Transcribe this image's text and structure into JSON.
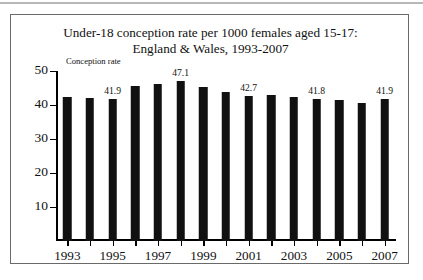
{
  "chart_data": {
    "type": "bar",
    "title": "Under-18 conception rate per 1000 females aged 15-17:",
    "subtitle": "England & Wales, 1993-2007",
    "axis_label": "Conception rate",
    "xlabel": "",
    "ylabel": "Conception rate",
    "ylim": [
      0,
      50
    ],
    "yticks": [
      10,
      20,
      30,
      40,
      50
    ],
    "grid": false,
    "legend": "none",
    "bar_color": "#111111",
    "categories": [
      "1993",
      "1994",
      "1995",
      "1996",
      "1997",
      "1998",
      "1999",
      "2000",
      "2001",
      "2002",
      "2003",
      "2004",
      "2005",
      "2006",
      "2007"
    ],
    "xtick_labels": [
      "1993",
      "1995",
      "1997",
      "1999",
      "2001",
      "2003",
      "2005",
      "2007"
    ],
    "values": [
      42.4,
      42.0,
      41.9,
      45.6,
      46.3,
      47.1,
      45.3,
      43.8,
      42.7,
      42.8,
      42.3,
      41.8,
      41.4,
      40.6,
      41.9
    ],
    "point_labels": [
      "",
      "",
      "41.9",
      "",
      "",
      "47.1",
      "",
      "",
      "42.7",
      "",
      "",
      "41.8",
      "",
      "",
      "41.9"
    ],
    "labelled_points": [
      {
        "category": "1995",
        "value": 41.9
      },
      {
        "category": "1998",
        "value": 47.1
      },
      {
        "category": "2001",
        "value": 42.7
      },
      {
        "category": "2004",
        "value": 41.8
      },
      {
        "category": "2007",
        "value": 41.9
      }
    ]
  }
}
